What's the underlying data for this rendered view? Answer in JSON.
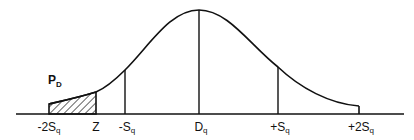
{
  "diagram": {
    "type": "normal-distribution-curve",
    "shaded_region": {
      "from": "-2Sq",
      "to": "Z",
      "pattern": "diagonal-hatch",
      "label_main": "P",
      "label_sub": "D"
    },
    "axis_labels": [
      {
        "main": "-2S",
        "sub": "q"
      },
      {
        "main": "Z",
        "sub": ""
      },
      {
        "main": "-S",
        "sub": "q"
      },
      {
        "main": "D",
        "sub": "q"
      },
      {
        "main": "+S",
        "sub": "q"
      },
      {
        "main": "+2S",
        "sub": "q"
      }
    ],
    "line_color": "#111111"
  }
}
